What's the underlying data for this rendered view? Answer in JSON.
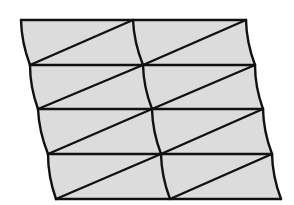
{
  "diagram": {
    "type": "triangulated-quad-mesh",
    "rows": 4,
    "cols": 2,
    "colors": {
      "background": "#ffffff",
      "fill": "#dcdcdc",
      "stroke": "#111111"
    },
    "stroke_width": 2.4,
    "curve_bulge": -4,
    "grid_points": [
      [
        [
          21,
          20
        ],
        [
          133,
          20
        ],
        [
          246,
          20
        ]
      ],
      [
        [
          30,
          65
        ],
        [
          143,
          65
        ],
        [
          255,
          65
        ]
      ],
      [
        [
          38,
          109
        ],
        [
          152,
          109
        ],
        [
          263,
          109
        ]
      ],
      [
        [
          48,
          154
        ],
        [
          161,
          154
        ],
        [
          272,
          154
        ]
      ],
      [
        [
          56,
          199
        ],
        [
          170,
          199
        ],
        [
          281,
          199
        ]
      ]
    ],
    "diagonal_direction": "bottom-left-to-top-right"
  }
}
